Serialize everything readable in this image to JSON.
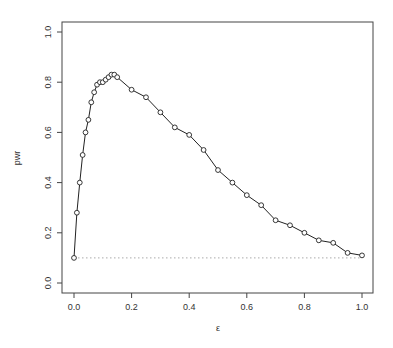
{
  "chart_data": {
    "type": "line",
    "title": "",
    "xlabel": "ε",
    "ylabel": "pwr",
    "xlim": [
      0,
      1
    ],
    "ylim": [
      0,
      1
    ],
    "grid": false,
    "legend": null,
    "x_ticks": [
      "0.0",
      "0.2",
      "0.4",
      "0.6",
      "0.8",
      "1.0"
    ],
    "y_ticks": [
      "0.0",
      "0.2",
      "0.4",
      "0.6",
      "0.8",
      "1.0"
    ],
    "series": [
      {
        "name": "pwr",
        "marker": "open-circle",
        "line": "solid",
        "x": [
          0,
          0.01,
          0.02,
          0.03,
          0.04,
          0.05,
          0.06,
          0.07,
          0.08,
          0.09,
          0.1,
          0.11,
          0.12,
          0.13,
          0.14,
          0.15,
          0.2,
          0.25,
          0.3,
          0.35,
          0.4,
          0.45,
          0.5,
          0.55,
          0.6,
          0.65,
          0.7,
          0.75,
          0.8,
          0.85,
          0.9,
          0.95,
          1.0
        ],
        "values": [
          0.1,
          0.28,
          0.4,
          0.51,
          0.6,
          0.65,
          0.72,
          0.76,
          0.79,
          0.8,
          0.8,
          0.81,
          0.82,
          0.83,
          0.83,
          0.82,
          0.77,
          0.74,
          0.68,
          0.62,
          0.59,
          0.53,
          0.45,
          0.4,
          0.35,
          0.31,
          0.25,
          0.23,
          0.2,
          0.17,
          0.16,
          0.12,
          0.11
        ]
      }
    ],
    "reference_line": {
      "y": 0.1,
      "style": "dotted",
      "color": "#aaaaaa"
    }
  }
}
